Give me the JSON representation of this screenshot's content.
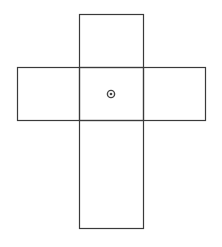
{
  "diagram": {
    "type": "cube-net-cross",
    "stroke_color": "#3a3a3a",
    "background": "#ffffff",
    "faces": [
      {
        "name": "top",
        "x": 79,
        "y": 14,
        "w": 64,
        "h": 53
      },
      {
        "name": "left",
        "x": 17,
        "y": 67,
        "w": 62,
        "h": 53
      },
      {
        "name": "center",
        "x": 79,
        "y": 67,
        "w": 64,
        "h": 53
      },
      {
        "name": "right",
        "x": 143,
        "y": 67,
        "w": 62,
        "h": 53
      },
      {
        "name": "bottom",
        "x": 79,
        "y": 120,
        "w": 64,
        "h": 108
      }
    ],
    "marker": {
      "cx": 111,
      "cy": 94,
      "r_outer": 3.6,
      "r_inner": 1.3,
      "color": "#444444"
    }
  }
}
